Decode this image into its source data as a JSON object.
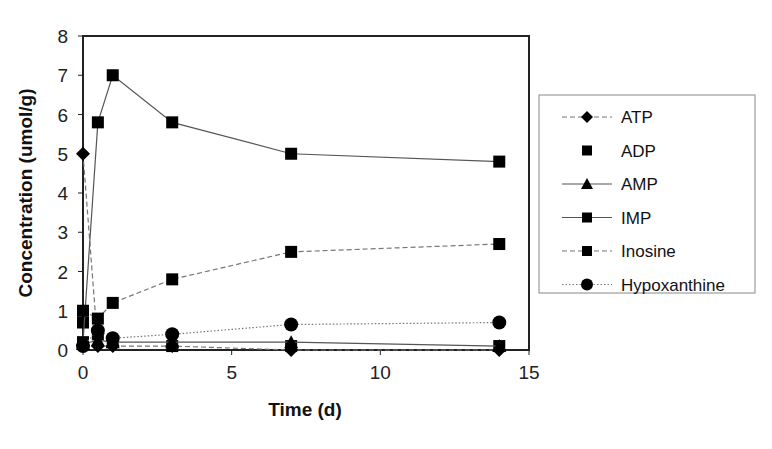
{
  "chart_data": {
    "type": "line",
    "title": "",
    "xlabel": "Time (d)",
    "ylabel": "Concentration (umol/g)",
    "xlim": [
      0,
      15
    ],
    "ylim": [
      0,
      8
    ],
    "xticks": [
      0,
      5,
      10,
      15
    ],
    "yticks": [
      0,
      1,
      2,
      3,
      4,
      5,
      6,
      7,
      8
    ],
    "grid": false,
    "legend_position": "right",
    "series": [
      {
        "name": "ATP",
        "marker": "diamond",
        "line": "dashed",
        "x": [
          0,
          0.5,
          1,
          3,
          7,
          14
        ],
        "y": [
          5.0,
          0.1,
          0.1,
          0.1,
          0.0,
          0.0
        ]
      },
      {
        "name": "ADP",
        "marker": "square",
        "line": "none",
        "x": [
          0,
          0.5,
          1,
          3,
          7,
          14
        ],
        "y": [
          0.7,
          0.4,
          0.2,
          0.1,
          0.1,
          0.1
        ]
      },
      {
        "name": "AMP",
        "marker": "triangle",
        "line": "solid",
        "x": [
          0,
          0.5,
          1,
          3,
          7,
          14
        ],
        "y": [
          0.15,
          0.25,
          0.2,
          0.2,
          0.2,
          0.1
        ]
      },
      {
        "name": "IMP",
        "marker": "square",
        "line": "solid",
        "x": [
          0,
          0.5,
          1,
          3,
          7,
          14
        ],
        "y": [
          0.2,
          5.8,
          7.0,
          5.8,
          5.0,
          4.8
        ]
      },
      {
        "name": "Inosine",
        "marker": "square",
        "line": "dashed",
        "x": [
          0,
          0.5,
          1,
          3,
          7,
          14
        ],
        "y": [
          1.0,
          0.8,
          1.2,
          1.8,
          2.5,
          2.7
        ]
      },
      {
        "name": "Hypoxanthine",
        "marker": "circle",
        "line": "dotted",
        "x": [
          0,
          0.5,
          1,
          3,
          7,
          14
        ],
        "y": [
          0.1,
          0.5,
          0.3,
          0.4,
          0.65,
          0.7
        ]
      }
    ]
  },
  "legend": {
    "items": [
      "ATP",
      "ADP",
      "AMP",
      "IMP",
      "Inosine",
      "Hypoxanthine"
    ]
  }
}
